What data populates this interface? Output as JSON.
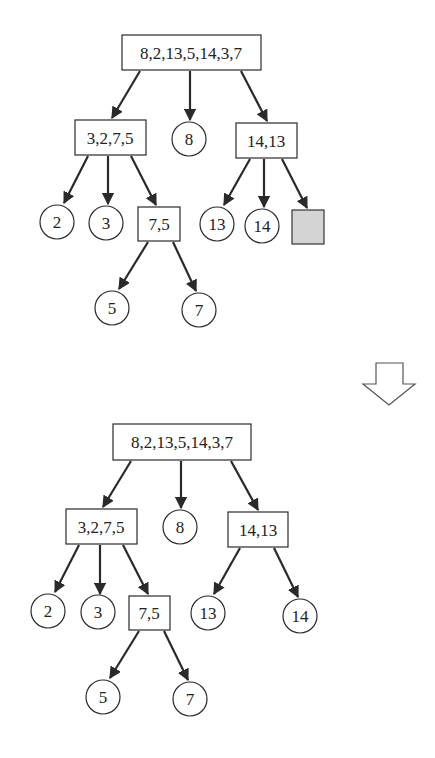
{
  "diagram": {
    "type": "tree-transformation",
    "colors": {
      "stroke": "#2a2a2a",
      "empty_fill": "#d4d4d4",
      "background": "#ffffff"
    },
    "transition_icon": "down-arrow-outline",
    "top_tree": {
      "root": "8,2,13,5,14,3,7",
      "level1": [
        "3,2,7,5",
        "8",
        "14,13"
      ],
      "level2_left": [
        "2",
        "3",
        "7,5"
      ],
      "level2_right": [
        "13",
        "14",
        ""
      ],
      "level3": [
        "5",
        "7"
      ]
    },
    "bottom_tree": {
      "root": "8,2,13,5,14,3,7",
      "level1": [
        "3,2,7,5",
        "8",
        "14,13"
      ],
      "level2_left": [
        "2",
        "3",
        "7,5"
      ],
      "level2_right": [
        "13",
        "14"
      ],
      "level3": [
        "5",
        "7"
      ]
    }
  }
}
